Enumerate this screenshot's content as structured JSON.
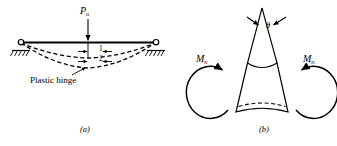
{
  "figure": {
    "panels": [
      {
        "id": "a",
        "caption": "(a)",
        "title": "Simply supported beam with plastic hinge at midspan",
        "labels": {
          "load": "P",
          "load_sub": "u",
          "deflection_1": "1",
          "deflection_2": "2",
          "hinge": "Plastic hinge"
        },
        "supports": [
          "pin-left",
          "pin-right"
        ],
        "colors": {
          "line": "#000000",
          "background": "#ffffff"
        }
      },
      {
        "id": "b",
        "caption": "(b)",
        "title": "Plastic hinge rotation detail",
        "labels": {
          "rotation": "θ",
          "moment_left": "M",
          "moment_left_sub": "n",
          "moment_right": "M",
          "moment_right_sub": "n"
        },
        "colors": {
          "line": "#000000",
          "background": "#ffffff"
        }
      }
    ]
  }
}
